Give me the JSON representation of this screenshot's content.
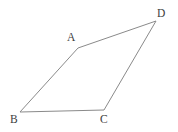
{
  "figure": {
    "type": "quadrilateral-diagram",
    "canvas": {
      "width": 178,
      "height": 132,
      "background": "#ffffff"
    },
    "stroke_color": "#8a8a8a",
    "label_color": "#3d3d3d",
    "vertices": [
      {
        "id": "A",
        "label": "A",
        "x": 78,
        "y": 48,
        "label_x": 67,
        "label_y": 32
      },
      {
        "id": "B",
        "label": "B",
        "x": 20,
        "y": 112,
        "label_x": 10,
        "label_y": 114
      },
      {
        "id": "C",
        "label": "C",
        "x": 104,
        "y": 110,
        "label_x": 100,
        "label_y": 114
      },
      {
        "id": "D",
        "label": "D",
        "x": 156,
        "y": 21,
        "label_x": 157,
        "label_y": 8
      }
    ],
    "edges": [
      {
        "id": "BA",
        "from": "B",
        "to": "A",
        "points": "20,112 78,48"
      },
      {
        "id": "AD",
        "from": "A",
        "to": "D",
        "points": "78,48 156,21"
      },
      {
        "id": "DC",
        "from": "D",
        "to": "C",
        "points": "156,21 104,110"
      },
      {
        "id": "CB",
        "from": "C",
        "to": "B",
        "points": "104,110 20,112"
      }
    ],
    "outline_points": "20,112 78,48 156,21 104,110 20,112"
  }
}
